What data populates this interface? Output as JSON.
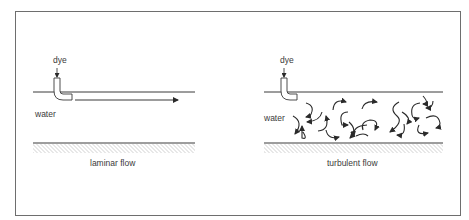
{
  "diagram": {
    "panels": [
      {
        "id": "laminar",
        "dye_label": "dye",
        "water_label": "water",
        "caption": "laminar flow"
      },
      {
        "id": "turbulent",
        "dye_label": "dye",
        "water_label": "water",
        "caption": "turbulent flow"
      }
    ],
    "colors": {
      "line": "#3a3a3a",
      "frame": "#6e6e6e",
      "hatch": "#8a8a8a"
    }
  }
}
